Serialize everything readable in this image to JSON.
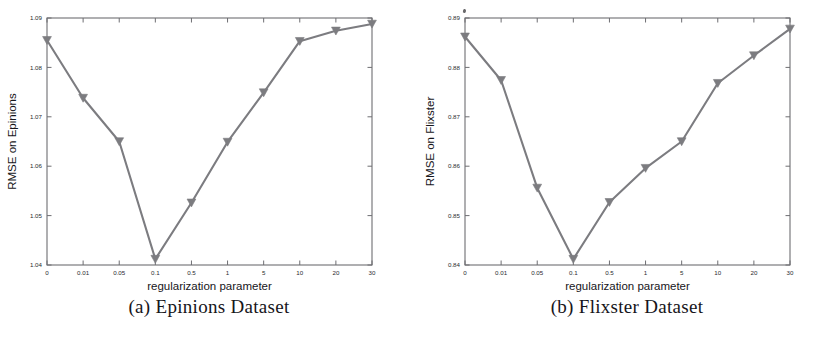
{
  "figure": {
    "background": "#ffffff",
    "line_color": "#7c7c80",
    "axis_color": "#6e6e72",
    "text_color": "#2a2a2e",
    "marker": "triangle-down"
  },
  "panels": [
    {
      "id": "panel-a",
      "caption": "(a) Epinions Dataset",
      "chart": {
        "ylabel": "RMSE on Epinions",
        "xlabel": "regularization parameter",
        "ytick_labels": [
          "1.09",
          "1.08",
          "1.07",
          "1.06",
          "1.05",
          "1.04"
        ],
        "xtick_labels": [
          "0",
          "0.01",
          "0.05",
          "0.1",
          "0.5",
          "1",
          "5",
          "10",
          "20",
          "30"
        ]
      }
    },
    {
      "id": "panel-b",
      "caption": "(b) Flixster Dataset",
      "chart": {
        "ylabel": "RMSE on Flixster",
        "xlabel": "regularization parameter",
        "ytick_labels": [
          "0.89",
          "0.88",
          "0.87",
          "0.86",
          "0.85",
          "0.84"
        ],
        "xtick_labels": [
          "0",
          "0.01",
          "0.05",
          "0.1",
          "0.5",
          "1",
          "5",
          "10",
          "20",
          "30"
        ]
      }
    }
  ],
  "chart_data": [
    {
      "type": "line",
      "title": "(a) Epinions Dataset",
      "xlabel": "regularization parameter",
      "ylabel": "RMSE on Epinions",
      "categories": [
        "0",
        "0.01",
        "0.05",
        "0.1",
        "0.5",
        "1",
        "5",
        "10",
        "20",
        "30"
      ],
      "values": [
        1.0855,
        1.0738,
        1.065,
        1.0412,
        1.0526,
        1.0649,
        1.0749,
        1.0853,
        1.0874,
        1.0888
      ],
      "ylim": [
        1.04,
        1.09
      ],
      "yticks": [
        1.04,
        1.05,
        1.06,
        1.07,
        1.08,
        1.09
      ],
      "grid": false,
      "legend": "none",
      "marker": "triangle-down",
      "color": "#7c7c80"
    },
    {
      "type": "line",
      "title": "(b) Flixster Dataset",
      "xlabel": "regularization parameter",
      "ylabel": "RMSE on Flixster",
      "categories": [
        "0",
        "0.01",
        "0.05",
        "0.1",
        "0.5",
        "1",
        "5",
        "10",
        "20",
        "30"
      ],
      "values": [
        0.8862,
        0.8774,
        0.8556,
        0.8412,
        0.8527,
        0.8596,
        0.865,
        0.8768,
        0.8824,
        0.8878
      ],
      "ylim": [
        0.84,
        0.89
      ],
      "yticks": [
        0.84,
        0.85,
        0.86,
        0.87,
        0.88,
        0.89
      ],
      "grid": false,
      "legend": "none",
      "marker": "triangle-down",
      "color": "#7c7c80"
    }
  ]
}
